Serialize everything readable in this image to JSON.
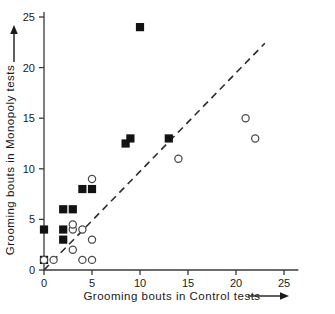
{
  "chart_data": {
    "type": "scatter",
    "title": "",
    "xlabel": "Grooming bouts in Control tests",
    "ylabel": "Grooming bouts in Monopoly tests",
    "xlim": [
      0,
      26.5
    ],
    "ylim": [
      0,
      25.5
    ],
    "xticks": [
      0,
      5,
      10,
      15,
      20,
      25
    ],
    "yticks": [
      0,
      5,
      10,
      15,
      20,
      25
    ],
    "xtick_labels": [
      "0",
      "5",
      "10",
      "15",
      "20",
      "25"
    ],
    "ytick_labels": [
      "0",
      "5",
      "10",
      "15",
      "20",
      "25"
    ],
    "grid": false,
    "legend": "none",
    "xlabel_arrow": "right-arrow-icon",
    "ylabel_arrow": "up-arrow-icon",
    "reference_line": {
      "name": "identity-line",
      "style": "dashed",
      "x": [
        0,
        23
      ],
      "y": [
        0,
        22.4
      ],
      "color": "#2b2b2b"
    },
    "series": [
      {
        "name": "Filled squares",
        "marker": "filled-square",
        "color": "#121212",
        "points": [
          {
            "x": 0,
            "y": 1
          },
          {
            "x": 0,
            "y": 4
          },
          {
            "x": 2,
            "y": 3
          },
          {
            "x": 2,
            "y": 4
          },
          {
            "x": 2,
            "y": 6
          },
          {
            "x": 3,
            "y": 6
          },
          {
            "x": 4,
            "y": 8
          },
          {
            "x": 5,
            "y": 8
          },
          {
            "x": 8.5,
            "y": 12.5
          },
          {
            "x": 9,
            "y": 13
          },
          {
            "x": 10,
            "y": 24
          },
          {
            "x": 13,
            "y": 13
          }
        ]
      },
      {
        "name": "Open circles",
        "marker": "open-circle",
        "color": "#4a4a4a",
        "points": [
          {
            "x": 0,
            "y": 1
          },
          {
            "x": 1,
            "y": 1
          },
          {
            "x": 3,
            "y": 2
          },
          {
            "x": 3,
            "y": 4
          },
          {
            "x": 3,
            "y": 4.5
          },
          {
            "x": 4,
            "y": 1
          },
          {
            "x": 4,
            "y": 4
          },
          {
            "x": 5,
            "y": 1
          },
          {
            "x": 5,
            "y": 3
          },
          {
            "x": 5,
            "y": 9
          },
          {
            "x": 14,
            "y": 11
          },
          {
            "x": 21,
            "y": 15
          },
          {
            "x": 22,
            "y": 13
          }
        ]
      }
    ]
  }
}
